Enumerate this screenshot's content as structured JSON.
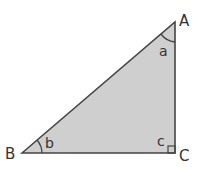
{
  "diagram": {
    "type": "right-triangle",
    "fill_color": "#cfcfcf",
    "stroke_color": "#444444",
    "vertices": [
      {
        "label": "A",
        "x": 175,
        "y": 22
      },
      {
        "label": "B",
        "x": 22,
        "y": 153
      },
      {
        "label": "C",
        "x": 175,
        "y": 153
      }
    ],
    "angles": [
      {
        "label": "a",
        "vertex": "A"
      },
      {
        "label": "b",
        "vertex": "B"
      },
      {
        "label": "c",
        "vertex": "C",
        "right_angle": true
      }
    ]
  }
}
